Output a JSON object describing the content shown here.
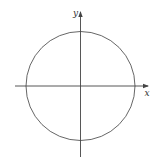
{
  "diagram": {
    "type": "unit-circle-on-cartesian-axes",
    "colors": {
      "stroke": "#444444",
      "background": "#ffffff"
    },
    "axes": {
      "x": {
        "label": "x"
      },
      "y": {
        "label": "y"
      }
    },
    "circle": {
      "centered_at_origin": true
    }
  }
}
